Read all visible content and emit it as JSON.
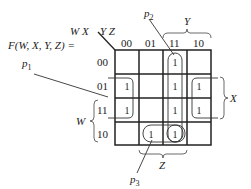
{
  "function_label": "F(W, X, Y, Z) =",
  "row_var_label": "W X",
  "col_var_label": "Y Z",
  "column_headers": [
    "00",
    "01",
    "11",
    "10"
  ],
  "row_headers": [
    "00",
    "01",
    "11",
    "10"
  ],
  "cells": [
    [
      "",
      "",
      "1",
      ""
    ],
    [
      "1",
      "",
      "1",
      "1"
    ],
    [
      "1",
      "",
      "1",
      "1"
    ],
    [
      "",
      "1",
      "1",
      ""
    ]
  ],
  "brace_labels": {
    "top": "Y",
    "right": "X",
    "left": "W",
    "bottom": "Z"
  },
  "prime_implicants": [
    {
      "label": "p",
      "sub": "1"
    },
    {
      "label": "p",
      "sub": "2"
    },
    {
      "label": "p",
      "sub": "3"
    }
  ]
}
